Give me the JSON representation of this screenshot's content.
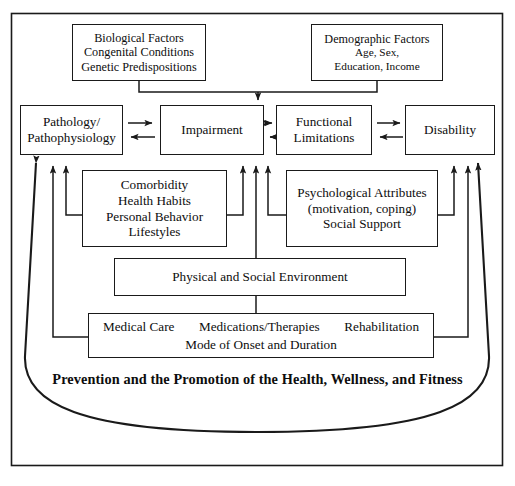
{
  "diagram": {
    "title_caption": "Prevention and the Promotion of the Health, Wellness, and Fitness",
    "boxes": {
      "biological": {
        "line1": "Biological Factors",
        "line2": "Congenital Conditions",
        "line3": "Genetic Predispositions"
      },
      "demographic": {
        "line1": "Demographic Factors",
        "line2": "Age, Sex,",
        "line3": "Education, Income"
      },
      "pathology": {
        "line1": "Pathology/",
        "line2": "Pathophysiology"
      },
      "impairment": {
        "line1": "Impairment"
      },
      "functional": {
        "line1": "Functional",
        "line2": "Limitations"
      },
      "disability": {
        "line1": "Disability"
      },
      "comorbidity": {
        "line1": "Comorbidity",
        "line2": "Health Habits",
        "line3": "Personal Behavior",
        "line4": "Lifestyles"
      },
      "psychological": {
        "line1": "Psychological Attributes",
        "line2": "(motivation, coping)",
        "line3": "Social Support"
      },
      "environment": {
        "line1": "Physical and Social Environment"
      },
      "medical": {
        "item1": "Medical Care",
        "item2": "Medications/Therapies",
        "item3": "Rehabilitation",
        "line2": "Mode of Onset and Duration"
      }
    },
    "colors": {
      "line": "#1a1a1a",
      "background": "#ffffff",
      "text": "#0d0d0d"
    }
  }
}
